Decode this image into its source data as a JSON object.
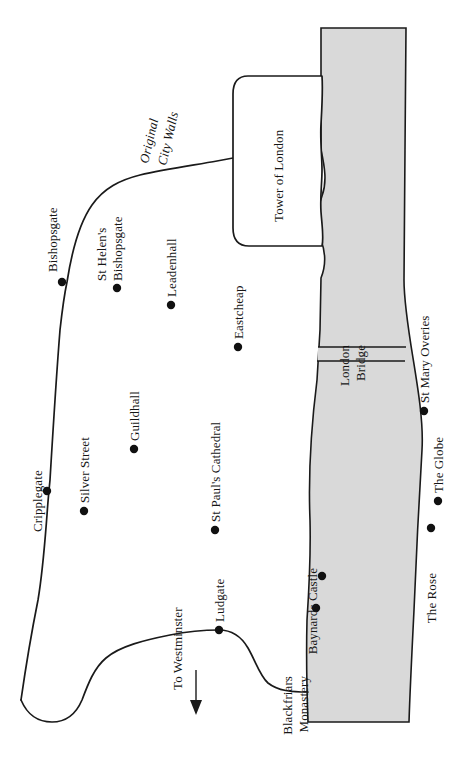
{
  "map": {
    "title": "Map of Elizabethan London",
    "orientation": "rotated-90-ccw-labels",
    "colors": {
      "river_fill": "#d9d9d9",
      "ink": "#1a1a1a",
      "paper": "#ffffff"
    },
    "river": {
      "name_visible": false,
      "label": ""
    },
    "bridge": {
      "label_line1": "London",
      "label_line2": "Bridge"
    },
    "tower": {
      "label": "Tower of London"
    },
    "walls": {
      "label_line1": "Original",
      "label_line2": "City Walls"
    },
    "direction_note": {
      "label": "To Westminster"
    },
    "places": [
      {
        "id": "bishopsgate",
        "label": "Bishopsgate",
        "has_dot": true
      },
      {
        "id": "st-helens-bishopsgate",
        "label_line1": "St Helen's",
        "label_line2": "Bishopsgate",
        "has_dot": true
      },
      {
        "id": "leadenhall",
        "label": "Leadenhall",
        "has_dot": true
      },
      {
        "id": "eastcheap",
        "label": "Eastcheap",
        "has_dot": true
      },
      {
        "id": "cripplegate",
        "label": "Cripplegate",
        "has_dot": true
      },
      {
        "id": "silver-street",
        "label": "Silver Street",
        "has_dot": true
      },
      {
        "id": "guildhall",
        "label": "Guildhall",
        "has_dot": true
      },
      {
        "id": "st-pauls-cathedral",
        "label": "St Paul's Cathedral",
        "has_dot": true
      },
      {
        "id": "ludgate",
        "label": "Ludgate",
        "has_dot": true
      },
      {
        "id": "baynards-castle",
        "label": "Baynards Castle",
        "has_dot": true
      },
      {
        "id": "blackfriars-monastery",
        "label_line1": "Blackfriars",
        "label_line2": "Monastery",
        "has_dot": true
      },
      {
        "id": "st-mary-overies",
        "label": "St Mary Overies",
        "has_dot": true
      },
      {
        "id": "the-globe",
        "label": "The Globe",
        "has_dot": true
      },
      {
        "id": "the-rose",
        "label": "The Rose",
        "has_dot": true
      }
    ]
  }
}
